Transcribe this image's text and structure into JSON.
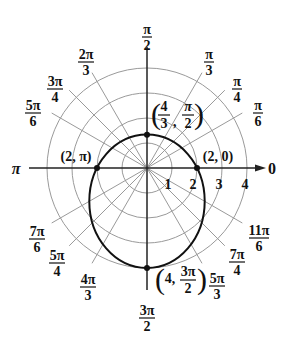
{
  "diagram": {
    "type": "polar-graph",
    "equation_shape": "ellipse r = 2/(1 + 0.5 sin θ)",
    "center_px": [
      147,
      168
    ],
    "unit_px": 25,
    "rings": [
      1,
      2,
      3,
      4
    ],
    "radial_tick_labels": [
      "1",
      "2",
      "3",
      "4"
    ],
    "polar_axis_label_right": "0",
    "polar_axis_label_left": "π",
    "angle_labels": [
      {
        "id": "pi-over-2",
        "num": "π",
        "den": "2",
        "x": 147,
        "y": 22
      },
      {
        "id": "pi-over-3",
        "num": "π",
        "den": "3",
        "x": 209,
        "y": 47
      },
      {
        "id": "pi-over-4",
        "num": "π",
        "den": "4",
        "x": 237,
        "y": 74
      },
      {
        "id": "pi-over-6",
        "num": "π",
        "den": "6",
        "x": 258,
        "y": 98
      },
      {
        "id": "2pi-over-3",
        "num": "2π",
        "den": "3",
        "x": 86,
        "y": 47
      },
      {
        "id": "3pi-over-4",
        "num": "3π",
        "den": "4",
        "x": 55,
        "y": 74
      },
      {
        "id": "5pi-over-6",
        "num": "5π",
        "den": "6",
        "x": 33,
        "y": 98
      },
      {
        "id": "7pi-over-6",
        "num": "7π",
        "den": "6",
        "x": 37,
        "y": 224
      },
      {
        "id": "5pi-over-4",
        "num": "5π",
        "den": "4",
        "x": 57,
        "y": 248
      },
      {
        "id": "4pi-over-3",
        "num": "4π",
        "den": "3",
        "x": 88,
        "y": 272
      },
      {
        "id": "3pi-over-2",
        "num": "3π",
        "den": "2",
        "x": 147,
        "y": 303
      },
      {
        "id": "5pi-over-3",
        "num": "5π",
        "den": "3",
        "x": 217,
        "y": 271
      },
      {
        "id": "7pi-over-4",
        "num": "7π",
        "den": "4",
        "x": 237,
        "y": 247
      },
      {
        "id": "11pi-over-6",
        "num": "11π",
        "den": "6",
        "x": 259,
        "y": 223
      }
    ],
    "points": [
      {
        "label": "(2, π)",
        "r": 2,
        "theta": "π"
      },
      {
        "label": "(2, 0)",
        "r": 2,
        "theta": "0"
      },
      {
        "label_prefix": "4/3",
        "label_theta": "π/2",
        "r": 1.3333,
        "theta": "π/2"
      },
      {
        "label_prefix": "4",
        "label_theta": "3π/2",
        "r": 4,
        "theta": "3π/2"
      }
    ],
    "point_labels": {
      "p_pi": "(2, π)",
      "p_zero": "(2, 0)",
      "top_r_num": "4",
      "top_r_den": "3",
      "top_theta_num": "π",
      "top_theta_den": "2",
      "bottom_r": "4,",
      "bottom_theta_num": "3π",
      "bottom_theta_den": "2"
    },
    "colors": {
      "grid": "#9a9a9a",
      "axis": "#222222",
      "curve": "#111111"
    }
  }
}
